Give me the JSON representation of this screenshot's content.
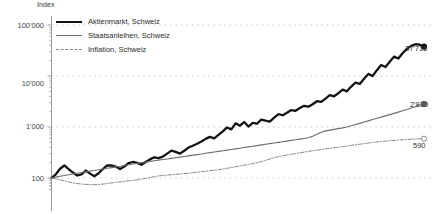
{
  "chart_data": {
    "type": "line",
    "title": "",
    "ylabel": "Index",
    "xlabel": "",
    "yscale": "log",
    "ylim": [
      60,
      100000
    ],
    "grid": true,
    "gridlines": [
      "100",
      "1'000",
      "10'000",
      "100'000"
    ],
    "legend_position": "top-left",
    "ytick_labels": [
      "100'000",
      "10'000",
      "1'000",
      "100"
    ],
    "ytick_values": [
      100000,
      10000,
      1000,
      100
    ],
    "legend": [
      {
        "name": "Aktienmarkt, Schweiz",
        "style": "solid-thick",
        "color": "#141414"
      },
      {
        "name": "Staatsanleihen, Schweiz",
        "style": "solid-thin",
        "color": "#6e6e6e"
      },
      {
        "name": "Inflation, Schweiz",
        "style": "dash-dot",
        "color": "#8a8a8a"
      }
    ],
    "end_labels": [
      {
        "series": "Aktienmarkt, Schweiz",
        "value": "37'716"
      },
      {
        "series": "Staatsanleihen, Schweiz",
        "value": "2'830"
      },
      {
        "series": "Inflation, Schweiz",
        "value": "590"
      }
    ],
    "series": [
      {
        "name": "Aktienmarkt, Schweiz",
        "color": "#141414",
        "marker_end": "filled-circle",
        "values": [
          100,
          118,
          152,
          176,
          150,
          128,
          112,
          118,
          140,
          122,
          108,
          124,
          150,
          176,
          176,
          168,
          150,
          168,
          196,
          206,
          198,
          182,
          205,
          232,
          255,
          246,
          262,
          300,
          345,
          325,
          300,
          342,
          395,
          430,
          470,
          520,
          585,
          640,
          600,
          700,
          820,
          980,
          900,
          1180,
          1060,
          1250,
          1020,
          1200,
          1160,
          1400,
          1330,
          1280,
          1520,
          1780,
          1700,
          1900,
          2150,
          2080,
          2350,
          2600,
          2500,
          2800,
          3200,
          3100,
          3600,
          4200,
          4000,
          4600,
          5400,
          5000,
          6200,
          7400,
          7000,
          8800,
          11000,
          10000,
          13000,
          16500,
          15000,
          19000,
          24000,
          22000,
          28000,
          34000,
          39000,
          42000,
          41000,
          37716
        ]
      },
      {
        "name": "Staatsanleihen, Schweiz",
        "color": "#6e6e6e",
        "marker_end": "filled-circle",
        "values": [
          100,
          104,
          108,
          112,
          116,
          120,
          124,
          128,
          132,
          136,
          140,
          145,
          150,
          155,
          160,
          165,
          170,
          176,
          182,
          188,
          194,
          200,
          206,
          212,
          218,
          224,
          230,
          236,
          243,
          250,
          257,
          264,
          272,
          280,
          288,
          296,
          305,
          314,
          323,
          332,
          342,
          352,
          362,
          373,
          384,
          396,
          408,
          420,
          432,
          445,
          458,
          472,
          486,
          500,
          515,
          530,
          546,
          562,
          579,
          596,
          614,
          660,
          720,
          790,
          840,
          870,
          900,
          930,
          960,
          1000,
          1060,
          1120,
          1180,
          1250,
          1320,
          1400,
          1480,
          1560,
          1650,
          1750,
          1850,
          1960,
          2080,
          2200,
          2350,
          2500,
          2700,
          2830
        ]
      },
      {
        "name": "Inflation, Schweiz",
        "color": "#8a8a8a",
        "marker_end": "open-circle",
        "values": [
          100,
          96,
          92,
          88,
          84,
          80,
          78,
          76,
          75,
          74,
          74,
          75,
          76,
          78,
          80,
          82,
          84,
          86,
          88,
          90,
          92,
          95,
          98,
          102,
          106,
          110,
          112,
          114,
          116,
          118,
          120,
          122,
          124,
          127,
          130,
          133,
          136,
          139,
          142,
          146,
          150,
          155,
          160,
          166,
          172,
          178,
          185,
          192,
          200,
          210,
          222,
          236,
          250,
          262,
          272,
          282,
          292,
          302,
          312,
          322,
          332,
          342,
          352,
          362,
          372,
          382,
          392,
          402,
          412,
          424,
          436,
          448,
          460,
          472,
          484,
          496,
          508,
          518,
          528,
          538,
          546,
          554,
          562,
          570,
          576,
          582,
          586,
          590
        ]
      }
    ]
  }
}
